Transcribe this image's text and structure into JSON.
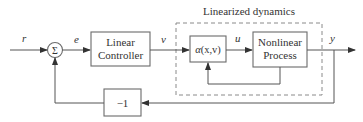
{
  "diagram": {
    "type": "block-diagram",
    "title": "Linearized dynamics",
    "signals": {
      "reference": "r",
      "error": "e",
      "virtual_input": "v",
      "control": "u",
      "output": "y"
    },
    "blocks": {
      "summing_junction": "Σ",
      "controller_line1": "Linear",
      "controller_line2": "Controller",
      "linearizer": "α(x,v)",
      "linearizer_alpha": "α",
      "linearizer_args": "(x,v)",
      "process_line1": "Nonlinear",
      "process_line2": "Process",
      "feedback_gain": "−1"
    },
    "colors": {
      "stroke": "#555555",
      "text": "#333333",
      "dashed_boundary": "#8a8a8a"
    }
  }
}
